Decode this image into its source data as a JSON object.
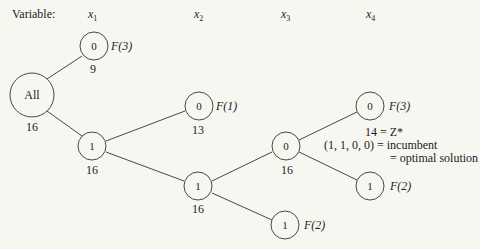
{
  "header": {
    "variable_label": "Variable:",
    "variables": [
      {
        "name": "x",
        "sub": "1"
      },
      {
        "name": "x",
        "sub": "2"
      },
      {
        "name": "x",
        "sub": "3"
      },
      {
        "name": "x",
        "sub": "4"
      }
    ]
  },
  "nodes": {
    "all": {
      "label": "All",
      "bound": "16"
    },
    "x1_0": {
      "label": "0",
      "bound": "9",
      "fathom": "F(3)"
    },
    "x1_1": {
      "label": "1",
      "bound": "16"
    },
    "x2_0": {
      "label": "0",
      "bound": "13",
      "fathom": "F(1)"
    },
    "x2_1": {
      "label": "1",
      "bound": "16"
    },
    "x3_0": {
      "label": "0",
      "bound": "16"
    },
    "x3_1": {
      "label": "1",
      "fathom": "F(2)"
    },
    "x4_0": {
      "label": "0",
      "fathom": "F(3)"
    },
    "x4_1": {
      "label": "1",
      "fathom": "F(2)"
    }
  },
  "annotation": {
    "line1": "14 = Z*",
    "line2": "(1, 1, 0, 0) = incumbent",
    "line3": "= optimal solution"
  }
}
